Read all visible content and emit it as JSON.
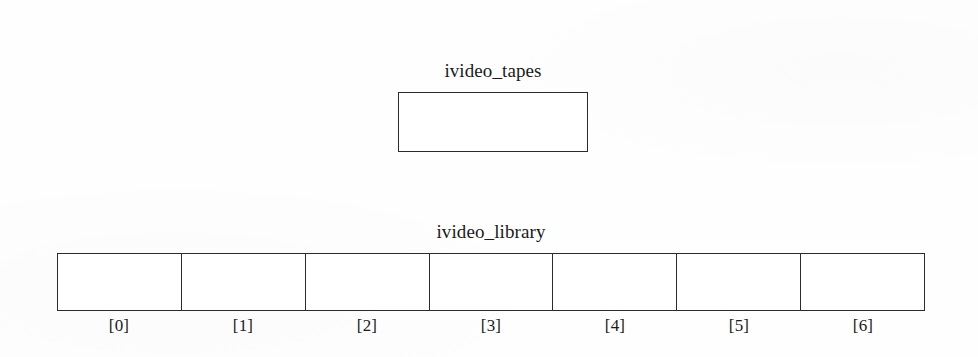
{
  "figure": {
    "background_color": "#fefefe",
    "ink_color": "#1a1a1a",
    "border_color": "#2b2b2b"
  },
  "scalar_variable": {
    "label": "ivideo_tapes",
    "cell_value": ""
  },
  "array_variable": {
    "label": "ivideo_library",
    "cells": [
      {
        "index_label": "[0]",
        "value": ""
      },
      {
        "index_label": "[1]",
        "value": ""
      },
      {
        "index_label": "[2]",
        "value": ""
      },
      {
        "index_label": "[3]",
        "value": ""
      },
      {
        "index_label": "[4]",
        "value": ""
      },
      {
        "index_label": "[5]",
        "value": ""
      },
      {
        "index_label": "[6]",
        "value": ""
      }
    ]
  }
}
